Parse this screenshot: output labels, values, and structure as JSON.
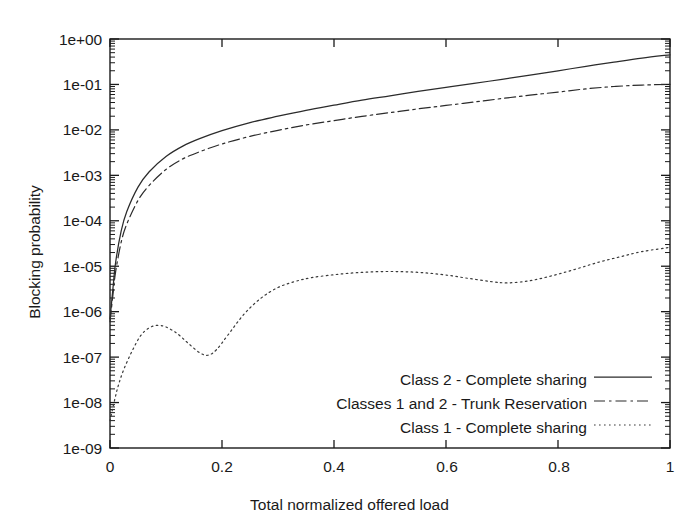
{
  "chart_data": {
    "type": "line",
    "title": "",
    "xlabel": "Total normalized offered load",
    "ylabel": "Blocking probability",
    "xlim": [
      0,
      1
    ],
    "ylim": [
      1e-09,
      1
    ],
    "yscale": "log",
    "xscale": "linear",
    "grid": false,
    "legend_position": "bottom-right-inside",
    "xticks": [
      0,
      0.2,
      0.4,
      0.6,
      0.8,
      1
    ],
    "xtick_labels": [
      "0",
      "0.2",
      "0.4",
      "0.6",
      "0.8",
      "1"
    ],
    "yticks": [
      1e-09,
      1e-08,
      1e-07,
      1e-06,
      1e-05,
      0.0001,
      0.001,
      0.01,
      0.1,
      1
    ],
    "ytick_labels": [
      "1e-09",
      "1e-08",
      "1e-07",
      "1e-06",
      "1e-05",
      "1e-04",
      "1e-03",
      "1e-02",
      "1e-01",
      "1e+00"
    ],
    "minor_ticks": true,
    "series": [
      {
        "name": "Class 2 - Complete sharing",
        "style": "solid",
        "color": "#2b2b2b",
        "x": [
          0.0,
          0.005,
          0.01,
          0.02,
          0.03,
          0.05,
          0.07,
          0.1,
          0.13,
          0.16,
          0.2,
          0.25,
          0.3,
          0.35,
          0.4,
          0.45,
          0.5,
          0.55,
          0.6,
          0.65,
          0.7,
          0.75,
          0.8,
          0.85,
          0.9,
          0.95,
          1.0
        ],
        "y": [
          7e-07,
          3e-06,
          1.2e-05,
          6e-05,
          0.00016,
          0.00055,
          0.0012,
          0.0026,
          0.0044,
          0.0064,
          0.0096,
          0.0145,
          0.02,
          0.027,
          0.035,
          0.045,
          0.056,
          0.07,
          0.086,
          0.105,
          0.13,
          0.16,
          0.2,
          0.25,
          0.31,
          0.38,
          0.45
        ]
      },
      {
        "name": "Classes 1 and 2 - Trunk Reservation",
        "style": "dashdot",
        "color": "#2b2b2b",
        "x": [
          0.0,
          0.005,
          0.01,
          0.02,
          0.03,
          0.05,
          0.07,
          0.1,
          0.13,
          0.16,
          0.2,
          0.25,
          0.3,
          0.35,
          0.4,
          0.45,
          0.5,
          0.55,
          0.6,
          0.65,
          0.7,
          0.75,
          0.8,
          0.85,
          0.9,
          0.95,
          1.0
        ],
        "y": [
          6e-07,
          2.2e-06,
          7.5e-06,
          3.4e-05,
          8.5e-05,
          0.00028,
          0.0006,
          0.00135,
          0.0023,
          0.0033,
          0.0049,
          0.0072,
          0.0098,
          0.0128,
          0.016,
          0.0198,
          0.024,
          0.029,
          0.0345,
          0.041,
          0.049,
          0.058,
          0.068,
          0.08,
          0.09,
          0.097,
          0.1
        ]
      },
      {
        "name": "Class 1 - Complete sharing",
        "style": "dotted",
        "color": "#3a3a3a",
        "x": [
          0.0,
          0.008,
          0.015,
          0.025,
          0.04,
          0.055,
          0.07,
          0.085,
          0.1,
          0.12,
          0.14,
          0.16,
          0.175,
          0.19,
          0.21,
          0.24,
          0.27,
          0.3,
          0.33,
          0.36,
          0.4,
          0.44,
          0.48,
          0.52,
          0.56,
          0.6,
          0.64,
          0.68,
          0.71,
          0.75,
          0.79,
          0.83,
          0.87,
          0.91,
          0.95,
          1.0
        ],
        "y": [
          4e-09,
          1.1e-08,
          2.4e-08,
          5.5e-08,
          1.4e-07,
          3e-07,
          4.4e-07,
          5e-07,
          4.6e-07,
          3.3e-07,
          2e-07,
          1.25e-07,
          1.1e-07,
          1.45e-07,
          3e-07,
          9e-07,
          2e-06,
          3.4e-06,
          4.6e-06,
          5.6e-06,
          6.5e-06,
          7.2e-06,
          7.6e-06,
          7.6e-06,
          7.2e-06,
          6.4e-06,
          5.4e-06,
          4.6e-06,
          4.3e-06,
          4.8e-06,
          6.2e-06,
          8.5e-06,
          1.2e-05,
          1.6e-05,
          2.1e-05,
          2.6e-05
        ]
      }
    ]
  },
  "axes": {
    "x_title": "Total normalized offered load",
    "y_title": "Blocking probability",
    "x_tick_labels": [
      "0",
      "0.2",
      "0.4",
      "0.6",
      "0.8",
      "1"
    ],
    "y_tick_labels": [
      "1e+00",
      "1e-01",
      "1e-02",
      "1e-03",
      "1e-04",
      "1e-05",
      "1e-06",
      "1e-07",
      "1e-08",
      "1e-09"
    ]
  },
  "legend": {
    "entries": [
      {
        "label": "Class 2 - Complete sharing",
        "style": "solid"
      },
      {
        "label": "Classes 1 and 2 - Trunk Reservation",
        "style": "dashdot"
      },
      {
        "label": "Class 1 - Complete sharing",
        "style": "dotted"
      }
    ]
  },
  "colors": {
    "frame": "#1a1a1a",
    "curve": "#2b2b2b",
    "background": "#ffffff"
  }
}
